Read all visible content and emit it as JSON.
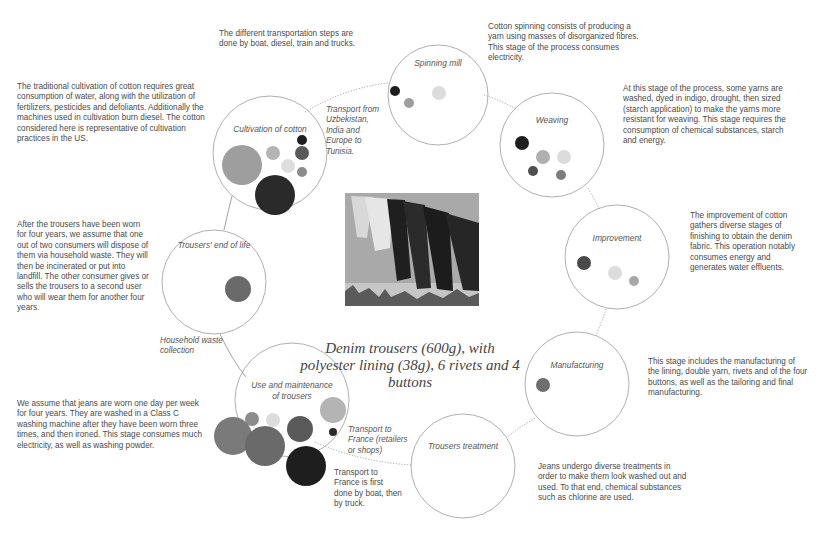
{
  "center": {
    "title": "Denim trousers (600g), with polyester lining (38g), 6 rivets and 4 buttons",
    "photo": "clothesline-jeans-photo"
  },
  "stages": [
    {
      "id": "spinning",
      "title": "Spinning mill",
      "description": "Cotton spinning consists of producing a yarn using masses of disorganized fibres. This stage of the process consumes electricity."
    },
    {
      "id": "weaving",
      "title": "Weaving",
      "description": "At this stage of the process, some yarns are washed, dyed in indigo, drought, then sized (starch application) to make the yarns more resistant for weaving. This stage requires the consumption of chemical substances, starch and energy."
    },
    {
      "id": "improvement",
      "title": "Improvement",
      "description": "The improvement of cotton gathers diverse stages of finishing to obtain the denim fabric. This operation notably consumes energy and generates water effluents."
    },
    {
      "id": "manufacturing",
      "title": "Manufacturing",
      "description": "This stage includes the manufacturing of the lining, double yarn, rivets and of the four buttons, as well as the tailoring and final manufacturing."
    },
    {
      "id": "treatment",
      "title": "Trousers treatment",
      "description": "Jeans undergo diverse treatments in order to make them look washed out and used. To that end, chemical substances such as chlorine are used."
    },
    {
      "id": "use",
      "title": "Use and maintenance of trousers",
      "description": "We assume that jeans are worn one day per week for four years. They are washed in a Class C washing machine after they have been worn three times, and then ironed. This stage consumes much electricity, as well as washing powder."
    },
    {
      "id": "endoflife",
      "title": "Trousers' end of life",
      "description": "After the trousers have been worn for four years, we assume that one out of two consumers will dispose of them via household waste. They will then be incinerated or put into landfill. The other consumer gives or sells the trousers to a second user who will wear them for another four years."
    },
    {
      "id": "cultivation",
      "title": "Cultivation of cotton",
      "description": "The traditional cultivation of cotton requires great consumption of water, along with the utilization of fertilizers, pesticides and defoliants. Additionally the machines used in cultivation burn diesel. The cotton considered here is representative of cultivation practices in the US."
    }
  ],
  "transport": {
    "general_note": "The different transportation steps are done by boat, diesel, train and trucks.",
    "from_uzbekistan": "Transport from Uzbekistan, India and Europe to Tunisia.",
    "to_france_label": "Transport to France (retailers or shops)",
    "to_france_note": "Transport to France is first done by boat, then by truck.",
    "household_waste": "Household waste collection"
  },
  "colors": {
    "black": "#1e1e1e",
    "dark": "#4f4f4f",
    "mid": "#6e6e6e",
    "grey": "#8c8c8c",
    "light": "#b4b4b4",
    "pale": "#dcdcdc",
    "stroke": "#9a9a9a"
  }
}
